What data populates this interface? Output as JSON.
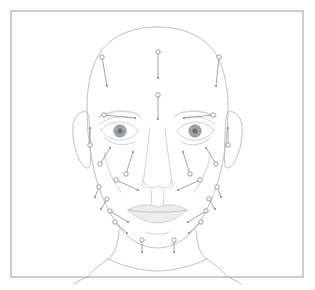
{
  "figure": {
    "canvas": {
      "width": 315,
      "height": 290
    },
    "frame": {
      "x": 11,
      "y": 11,
      "width": 292,
      "height": 266,
      "stroke": "#9a9a9a",
      "fill": "#ffffff"
    },
    "palette": {
      "background": "#ffffff",
      "outline": "#b9b9b9",
      "feature_line": "#c2c2c2",
      "marker_stroke": "#8d8d8d",
      "marker_fill": "#ffffff",
      "marker_dot": "#8d8d8d",
      "iris": "#9fa4a8",
      "pupil": "#6e7276",
      "lip": "#d6d6d6",
      "brow": "#cfcfcf"
    },
    "marker_legend": {
      "circle_end": "entry point",
      "dot_end": "target depth point",
      "circle_radius": 2.2,
      "dot_radius": 1.1
    },
    "marker_count": 24
  },
  "head": {
    "skull_outline": "M157.5,27 C186,27 207,38 217,56 C225,70 228,90 228,108 C228,132 225,152 221,170 C216,192 207,212 196,227 C186,240 172,248 157.5,248 C143,248 129,240 119,227 C108,212 99,192 94,170 C90,152 87,132 87,108 C87,90 90,70 98,56 C108,38 129,27 157.5,27 Z",
    "ear_left": "M87,112 C80,110 74,116 73,126 C72,138 75,152 80,161 C84,168 88,170 90,166 C91,158 90,134 89,118 Z",
    "ear_right": "M228,112 C235,110 241,116 242,126 C243,138 240,152 235,161 C231,168 227,170 225,166 C224,158 225,134 226,118 Z",
    "neck_left": "M119,230 C118,244 116,253 108,259 C100,265 92,270 88,277",
    "neck_right": "M196,230 C197,244 199,253 207,259 C215,265 223,270 227,277",
    "neck_base": "M108,259 C126,268 146,271 157.5,271 C169,271 189,268 207,259",
    "shoulder_left": "M88,277 C82,279 78,281 74,284",
    "shoulder_right": "M227,277 C233,279 237,281 241,284"
  },
  "features": {
    "brow_left": "M99,117 C108,112 120,110 131,112 C136,113 139,115 140,117",
    "brow_right": "M216,117 C207,112 195,110 184,112 C179,113 176,115 175,117",
    "eye_left_upper": "M101,130 C108,122 120,120 129,124 C134,126 137,129 138,131",
    "eye_left_lower": "M101,130 C105,137 114,141 123,140 C131,139 136,135 138,131",
    "eye_right_upper": "M214,130 C207,122 195,120 186,124 C181,126 178,129 177,131",
    "eye_right_lower": "M214,130 C210,137 201,141 192,140 C184,139 179,135 177,131",
    "eye_left_crease": "M100,124 C108,117 122,115 132,118",
    "eye_right_crease": "M215,124 C207,117 193,115 183,118",
    "eye_left_bag": "M104,137 C111,145 124,147 134,142",
    "eye_right_bag": "M211,137 C204,145 191,147 181,142",
    "iris_left": {
      "cx": 120,
      "cy": 131,
      "r": 6.2
    },
    "iris_right": {
      "cx": 195,
      "cy": 131,
      "r": 6.2
    },
    "pupil_left": {
      "cx": 120,
      "cy": 131,
      "r": 2.6
    },
    "pupil_right": {
      "cx": 195,
      "cy": 131,
      "r": 2.6
    },
    "nose_bridge_left": "M150,128 C148,146 146,162 144,176",
    "nose_bridge_right": "M165,128 C167,146 169,162 171,176",
    "nose_tip": "M144,176 C142,183 146,188 152,188 C155,188 156,186 157.5,186 C159,186 160,188 163,188 C169,188 173,183 171,176",
    "nostril_left": "M144,180 C141,183 141,187 145,188",
    "nostril_right": "M171,180 C174,183 174,187 170,188",
    "philtrum_left": "M152,190 C151,196 151,202 152,206",
    "philtrum_right": "M163,190 C164,196 164,202 163,206",
    "lip_upper": "M128,210 C137,205 147,203 157.5,207 C168,203 178,205 187,210",
    "lip_line": "M128,210 C142,213 173,213 187,210",
    "lip_lower": "M128,210 C138,220 150,223 157.5,223 C165,223 177,220 187,210",
    "chin_crease": "M146,232 C151,235 164,235 169,232",
    "cheek_left_hint": "M104,152 C107,168 113,182 121,192",
    "cheek_right_hint": "M211,152 C208,168 202,182 194,192"
  },
  "markers": [
    {
      "id": "forehead-left-lateral",
      "circle": [
        102,
        57
      ],
      "dot": [
        107,
        86
      ]
    },
    {
      "id": "forehead-center-upper",
      "circle": [
        158,
        52
      ],
      "dot": [
        158,
        78
      ]
    },
    {
      "id": "forehead-right-lateral",
      "circle": [
        219,
        57
      ],
      "dot": [
        216,
        86
      ]
    },
    {
      "id": "glabella-center",
      "circle": [
        158,
        95
      ],
      "dot": [
        158,
        119
      ]
    },
    {
      "id": "brow-left-tail",
      "circle": [
        104,
        115
      ],
      "dot": [
        135,
        118
      ]
    },
    {
      "id": "brow-right-tail",
      "circle": [
        213,
        115
      ],
      "dot": [
        184,
        118
      ]
    },
    {
      "id": "temple-left",
      "circle": [
        90,
        145
      ],
      "dot": [
        90,
        128
      ]
    },
    {
      "id": "temple-right",
      "circle": [
        228,
        145
      ],
      "dot": [
        228,
        128
      ]
    },
    {
      "id": "crowsfeet-left-upper",
      "circle": [
        100,
        164
      ],
      "dot": [
        110,
        148
      ]
    },
    {
      "id": "crowsfeet-right-upper",
      "circle": [
        216,
        164
      ],
      "dot": [
        206,
        148
      ]
    },
    {
      "id": "tear-trough-left",
      "circle": [
        126,
        174
      ],
      "dot": [
        133,
        152
      ]
    },
    {
      "id": "tear-trough-right",
      "circle": [
        190,
        174
      ],
      "dot": [
        183,
        152
      ]
    },
    {
      "id": "midcheek-left",
      "circle": [
        116,
        180
      ],
      "dot": [
        138,
        190
      ]
    },
    {
      "id": "midcheek-right",
      "circle": [
        200,
        180
      ],
      "dot": [
        178,
        190
      ]
    },
    {
      "id": "preauricular-left",
      "circle": [
        99,
        187
      ],
      "dot": [
        95,
        197
      ]
    },
    {
      "id": "preauricular-right",
      "circle": [
        217,
        187
      ],
      "dot": [
        221,
        197
      ]
    },
    {
      "id": "lower-cheek-left",
      "circle": [
        107,
        199
      ],
      "dot": [
        101,
        209
      ]
    },
    {
      "id": "lower-cheek-right",
      "circle": [
        209,
        199
      ],
      "dot": [
        215,
        209
      ]
    },
    {
      "id": "jawline-left-upper",
      "circle": [
        110,
        211
      ],
      "dot": [
        128,
        222
      ]
    },
    {
      "id": "jawline-right-upper",
      "circle": [
        206,
        211
      ],
      "dot": [
        188,
        222
      ]
    },
    {
      "id": "jawline-left-lower",
      "circle": [
        115,
        222
      ],
      "dot": [
        127,
        233
      ]
    },
    {
      "id": "jawline-right-lower",
      "circle": [
        201,
        222
      ],
      "dot": [
        189,
        233
      ]
    },
    {
      "id": "chin-left",
      "circle": [
        142,
        240
      ],
      "dot": [
        142,
        252
      ]
    },
    {
      "id": "chin-right",
      "circle": [
        174,
        240
      ],
      "dot": [
        174,
        252
      ]
    }
  ]
}
